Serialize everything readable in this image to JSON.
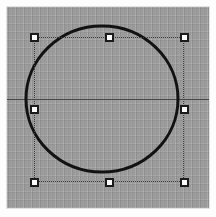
{
  "app": {
    "title": "Vector shape editor canvas",
    "canvas_background_color": "#9b9b9b",
    "page_background_color": "#fdfdfd",
    "grid_visible": true,
    "grid_spacing_px": 8
  },
  "canvas": {
    "x": 7,
    "y": 7,
    "width": 202,
    "height": 201
  },
  "guides": {
    "horizontal": {
      "label": "horizontal-guide",
      "y": 99,
      "color": "#3a3a3a"
    }
  },
  "shape": {
    "type": "ellipse",
    "label": "circle",
    "center_x": 102,
    "center_y": 99,
    "radius_x": 76,
    "radius_y": 73,
    "stroke_color": "#121212",
    "stroke_width": 3,
    "fill": "none",
    "selected": true
  },
  "selection": {
    "label": "selection-bounding-box",
    "left": 34,
    "top": 37,
    "width": 150,
    "height": 145,
    "outline_color": "#3d3d3d",
    "outline_style": "dotted",
    "handle_fill_color": "#fbfbfb",
    "handle_border_color": "#1b1b1b",
    "handle_size": 9,
    "handles": [
      {
        "id": "nw",
        "name": "top-left",
        "cursor": "nwse-resize"
      },
      {
        "id": "n",
        "name": "top-center",
        "cursor": "ns-resize"
      },
      {
        "id": "ne",
        "name": "top-right",
        "cursor": "nesw-resize"
      },
      {
        "id": "w",
        "name": "middle-left",
        "cursor": "ew-resize"
      },
      {
        "id": "e",
        "name": "middle-right",
        "cursor": "ew-resize"
      },
      {
        "id": "sw",
        "name": "bottom-left",
        "cursor": "nesw-resize"
      },
      {
        "id": "s",
        "name": "bottom-center",
        "cursor": "ns-resize"
      },
      {
        "id": "se",
        "name": "bottom-right",
        "cursor": "nwse-resize"
      }
    ]
  }
}
